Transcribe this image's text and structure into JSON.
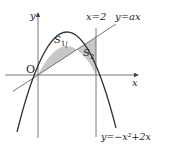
{
  "diagram": {
    "type": "function-graph",
    "origin_label": "O",
    "x_axis_label": "x",
    "y_axis_label": "y",
    "vertical_line_label": "x=2",
    "line_label": "y=ax",
    "parabola_label": "y=−x²+2x",
    "region_labels": {
      "s1": "S",
      "s1_sub": "1",
      "s2": "S",
      "s2_sub": "2"
    },
    "colors": {
      "shade": "#c8c8c8",
      "stroke": "#333333",
      "axis": "#555555"
    }
  }
}
